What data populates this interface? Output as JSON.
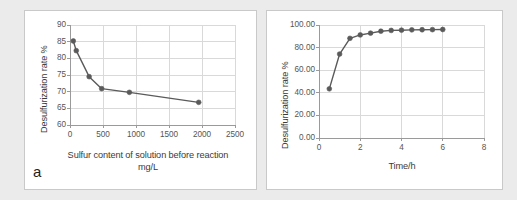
{
  "figure": {
    "background_color": "#ebebeb",
    "panel_background": "#ffffff",
    "panel_border_color": "#c9c9c9",
    "series_color": "#5a5a5a",
    "grid_color": "#d9d9d9",
    "axis_color": "#9a9a9a"
  },
  "panel_a": {
    "letter": "a",
    "chart_data": {
      "type": "line",
      "title": "",
      "xlabel": "Sulfur content of solution before reaction mg/L",
      "xlabel_line1": "Sulfur content of solution before reaction",
      "xlabel_line2": "mg/L",
      "ylabel": "Desulfurization rate %",
      "xlim": [
        0,
        2500
      ],
      "ylim": [
        60,
        90
      ],
      "xticks": [
        0,
        500,
        1000,
        1500,
        2000,
        2500
      ],
      "xtick_labels": [
        "0",
        "500",
        "1000",
        "1500",
        "2000",
        "2500"
      ],
      "yticks": [
        60,
        65,
        70,
        75,
        80,
        85,
        90
      ],
      "ytick_labels": [
        "60",
        "65",
        "70",
        "75",
        "80",
        "85",
        "90"
      ],
      "grid": true,
      "legend": "none",
      "marker": "circle",
      "series": [
        {
          "name": "Desulfurization rate",
          "x": [
            50,
            95,
            290,
            480,
            900,
            1950
          ],
          "y": [
            85.2,
            82.3,
            74.5,
            70.9,
            69.8,
            66.8
          ]
        }
      ]
    }
  },
  "panel_b": {
    "letter": "",
    "chart_data": {
      "type": "line",
      "title": "",
      "xlabel": "Time/h",
      "ylabel": "Desulfurization rate %",
      "xlim": [
        0,
        8
      ],
      "ylim": [
        0,
        100
      ],
      "xticks": [
        0,
        2,
        4,
        6,
        8
      ],
      "xtick_labels": [
        "0",
        "2",
        "4",
        "6",
        "8"
      ],
      "yticks": [
        0,
        20,
        40,
        60,
        80,
        100
      ],
      "ytick_labels": [
        "0.00",
        "20.00",
        "40.00",
        "60.00",
        "80.00",
        "100.00"
      ],
      "grid": true,
      "legend": "none",
      "marker": "circle",
      "series": [
        {
          "name": "Desulfurization rate",
          "x": [
            0.5,
            1.0,
            1.5,
            2.0,
            2.5,
            3.0,
            3.5,
            4.0,
            4.5,
            5.0,
            5.5,
            6.0
          ],
          "y": [
            43.5,
            74.3,
            88.2,
            91.2,
            92.8,
            94.5,
            95.2,
            95.4,
            95.7,
            95.8,
            95.9,
            96.0
          ]
        }
      ]
    }
  }
}
